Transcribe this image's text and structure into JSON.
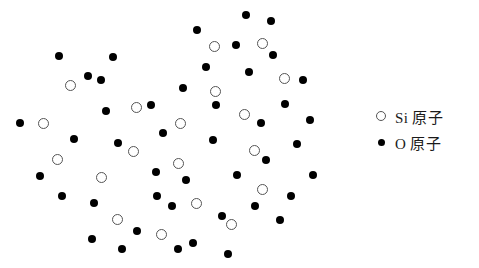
{
  "figure": {
    "background_color": "#ffffff"
  },
  "legend": {
    "position": "right",
    "items": [
      {
        "marker": "open-circle",
        "symbol": "Si",
        "label": "Si 原子",
        "color": "#ffffff",
        "stroke": "#555555"
      },
      {
        "marker": "filled-circle",
        "symbol": "O",
        "label": "O 原子",
        "color": "#000000",
        "stroke": "#000000"
      }
    ]
  },
  "structure": {
    "si_color": "#ffffff",
    "si_stroke": "#555555",
    "o_color": "#000000",
    "si_atoms": [
      {
        "x": 70,
        "y": 85
      },
      {
        "x": 43,
        "y": 123
      },
      {
        "x": 57,
        "y": 159
      },
      {
        "x": 101,
        "y": 177
      },
      {
        "x": 117,
        "y": 219
      },
      {
        "x": 161,
        "y": 234
      },
      {
        "x": 136,
        "y": 107
      },
      {
        "x": 133,
        "y": 151
      },
      {
        "x": 180,
        "y": 123
      },
      {
        "x": 178,
        "y": 163
      },
      {
        "x": 196,
        "y": 203
      },
      {
        "x": 214,
        "y": 46
      },
      {
        "x": 215,
        "y": 91
      },
      {
        "x": 244,
        "y": 114
      },
      {
        "x": 262,
        "y": 43
      },
      {
        "x": 284,
        "y": 78
      },
      {
        "x": 254,
        "y": 150
      },
      {
        "x": 262,
        "y": 189
      },
      {
        "x": 231,
        "y": 224
      }
    ],
    "o_atoms": [
      {
        "x": 20,
        "y": 123
      },
      {
        "x": 40,
        "y": 176
      },
      {
        "x": 59,
        "y": 56
      },
      {
        "x": 62,
        "y": 196
      },
      {
        "x": 74,
        "y": 139
      },
      {
        "x": 88,
        "y": 76
      },
      {
        "x": 94,
        "y": 203
      },
      {
        "x": 92,
        "y": 239
      },
      {
        "x": 101,
        "y": 80
      },
      {
        "x": 106,
        "y": 111
      },
      {
        "x": 113,
        "y": 57
      },
      {
        "x": 118,
        "y": 143
      },
      {
        "x": 122,
        "y": 249
      },
      {
        "x": 137,
        "y": 231
      },
      {
        "x": 151,
        "y": 105
      },
      {
        "x": 156,
        "y": 172
      },
      {
        "x": 157,
        "y": 196
      },
      {
        "x": 163,
        "y": 133
      },
      {
        "x": 172,
        "y": 206
      },
      {
        "x": 178,
        "y": 249
      },
      {
        "x": 183,
        "y": 88
      },
      {
        "x": 186,
        "y": 180
      },
      {
        "x": 193,
        "y": 243
      },
      {
        "x": 197,
        "y": 30
      },
      {
        "x": 206,
        "y": 67
      },
      {
        "x": 213,
        "y": 140
      },
      {
        "x": 216,
        "y": 105
      },
      {
        "x": 222,
        "y": 216
      },
      {
        "x": 228,
        "y": 254
      },
      {
        "x": 236,
        "y": 45
      },
      {
        "x": 237,
        "y": 175
      },
      {
        "x": 246,
        "y": 15
      },
      {
        "x": 249,
        "y": 72
      },
      {
        "x": 255,
        "y": 206
      },
      {
        "x": 261,
        "y": 123
      },
      {
        "x": 266,
        "y": 160
      },
      {
        "x": 271,
        "y": 21
      },
      {
        "x": 273,
        "y": 55
      },
      {
        "x": 280,
        "y": 220
      },
      {
        "x": 285,
        "y": 104
      },
      {
        "x": 291,
        "y": 196
      },
      {
        "x": 297,
        "y": 144
      },
      {
        "x": 303,
        "y": 80
      },
      {
        "x": 310,
        "y": 120
      },
      {
        "x": 313,
        "y": 175
      }
    ]
  }
}
